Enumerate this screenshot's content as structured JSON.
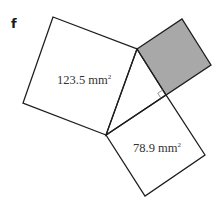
{
  "figure": {
    "label": "f",
    "colors": {
      "stroke": "#1e1e1e",
      "shaded_fill": "#a8a8a8",
      "right_angle_marker": "#888888",
      "text": "#333333"
    },
    "squares": [
      {
        "name": "large-square",
        "area_value": "123.5 mm",
        "area_exp": "2",
        "shaded": false,
        "points": "53,17 137,49 106,135 23,103"
      },
      {
        "name": "shaded-square",
        "area_value": "",
        "area_exp": "",
        "shaded": true,
        "points": "137,49 182,19 211,65 166,95"
      },
      {
        "name": "lower-square",
        "area_value": "78.9 mm",
        "area_exp": "2",
        "shaded": false,
        "points": "106,135 166,95 205,155 145,196"
      }
    ],
    "triangle": {
      "points": "137,49 166,95 106,135",
      "right_angle_vertex": "166,95",
      "right_angle_marker": "162.8,89.9 157.8,93.2 161.0,98.3"
    }
  }
}
